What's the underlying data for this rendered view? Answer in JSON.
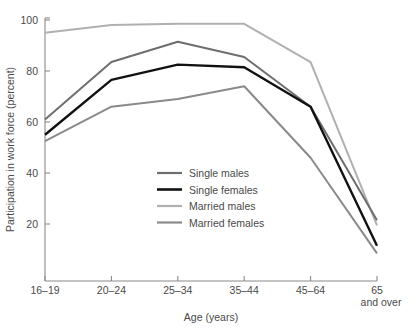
{
  "chart_data": {
    "type": "line",
    "title": "",
    "xlabel": "Age (years)",
    "ylabel": "Participation in work force (percent)",
    "categories": [
      "16–19",
      "20–24",
      "25–34",
      "35–44",
      "45–64",
      "65\nand over"
    ],
    "category_labels": [
      "16–19",
      "20–24",
      "25–34",
      "35–44",
      "45–64",
      "65"
    ],
    "last_category_second_line": "and over",
    "ylim": [
      0,
      100
    ],
    "yticks": [
      20,
      40,
      60,
      80,
      100
    ],
    "ytick_labels": [
      "20",
      "40",
      "60",
      "80",
      "100"
    ],
    "grid": false,
    "legend_position": "center",
    "series": [
      {
        "name": "Single males",
        "color": "#6e6e6e",
        "width": 2.0,
        "values": [
          61,
          83.5,
          91.5,
          85.5,
          66,
          21.5
        ]
      },
      {
        "name": "Single females",
        "color": "#111111",
        "width": 2.4,
        "values": [
          55,
          76.5,
          82.5,
          81.5,
          66,
          11.5
        ]
      },
      {
        "name": "Married males",
        "color": "#b0b0b0",
        "width": 2.0,
        "values": [
          95,
          98,
          98.5,
          98.5,
          83.5,
          19.5
        ]
      },
      {
        "name": "Married females",
        "color": "#8a8a8a",
        "width": 2.0,
        "values": [
          52.5,
          66,
          69,
          74,
          46,
          8.5
        ]
      }
    ]
  },
  "legend": {
    "items": [
      {
        "label": "Single males",
        "color": "#6e6e6e"
      },
      {
        "label": "Single females",
        "color": "#111111"
      },
      {
        "label": "Married males",
        "color": "#b0b0b0"
      },
      {
        "label": "Married females",
        "color": "#8a8a8a"
      }
    ]
  }
}
